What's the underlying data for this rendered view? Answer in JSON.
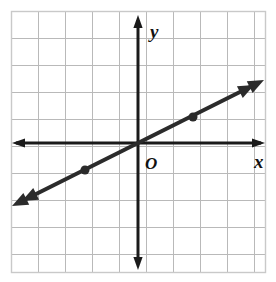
{
  "figure": {
    "kind": "coordinate-plane-line-graph",
    "background_color": "#ffffff",
    "grid": {
      "left": 11,
      "top": 11,
      "right": 265,
      "bottom": 272,
      "cell_size": 27,
      "columns": 9,
      "rows": 10,
      "line_color": "#b9b9b9",
      "border_color": "#c9c9c9",
      "visible": true
    },
    "axes": {
      "color": "#1a1a1a",
      "stroke_width": 3,
      "origin_px": {
        "x": 138,
        "y": 143
      },
      "x_axis": {
        "label": "x",
        "label_px": {
          "x": 254,
          "y": 162
        },
        "from_px": {
          "x": 13,
          "y": 143
        },
        "to_px": {
          "x": 265,
          "y": 143
        },
        "arrow_both_ends": true
      },
      "y_axis": {
        "label": "y",
        "label_px": {
          "x": 150,
          "y": 32
        },
        "from_px": {
          "x": 138,
          "y": 268
        },
        "to_px": {
          "x": 138,
          "y": 16
        },
        "arrow_both_ends": true
      },
      "origin_label": "O",
      "origin_label_px": {
        "x": 145,
        "y": 162
      }
    }
  },
  "chart_data": {
    "type": "line",
    "title": "",
    "xlabel": "x",
    "ylabel": "y",
    "xlim": [
      -4.7,
      4.7
    ],
    "ylim": [
      -4.8,
      4.9
    ],
    "grid": true,
    "legend": null,
    "series": [
      {
        "name": "line",
        "equation": "y = 0.5x",
        "slope": 0.5,
        "intercept": 0,
        "color": "#2b2b2b",
        "stroke_width": 4,
        "arrow_both_ends": true,
        "x": [
          -4.7,
          4.7
        ],
        "y": [
          -2.35,
          2.35
        ],
        "endpoints_px": [
          {
            "x": 12,
            "y": 206
          },
          {
            "x": 264,
            "y": 80
          }
        ],
        "marked_points": [
          {
            "x": -2,
            "y": -1,
            "px": {
              "x": 85,
              "y": 170
            }
          },
          {
            "x": 2,
            "y": 1,
            "px": {
              "x": 193,
              "y": 117
            }
          }
        ],
        "marker": "filled-dot",
        "marker_radius": 4.5
      }
    ]
  }
}
